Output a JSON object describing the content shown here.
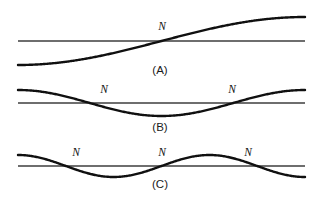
{
  "figure": {
    "width": 316,
    "height": 197,
    "background_color": "#ffffff",
    "curve_color": "#101010",
    "axis_color": "#6e6e6e",
    "label_color": "#111111",
    "node_symbol": "N"
  },
  "chart_data": {
    "type": "line",
    "xlabel": "",
    "ylabel": "",
    "grid": false,
    "legend_position": "none",
    "panels": [
      {
        "caption": "(A)",
        "harmonic": 1,
        "node_count": 1,
        "axis_y": 41,
        "x_start": 18,
        "x_end": 305,
        "amplitude": 24,
        "half_cycles": 1,
        "phase": "rising",
        "node_labels": [
          {
            "text": "N",
            "x": 162,
            "y": 30
          }
        ],
        "node_x_positions": [
          162
        ],
        "caption_position": {
          "x": 160,
          "y": 74
        }
      },
      {
        "caption": "(B)",
        "harmonic": 2,
        "node_count": 2,
        "axis_y": 103,
        "x_start": 18,
        "x_end": 305,
        "amplitude": 13,
        "half_cycles": 2,
        "phase": "crest-first",
        "node_labels": [
          {
            "text": "N",
            "x": 104,
            "y": 93
          },
          {
            "text": "N",
            "x": 232,
            "y": 93
          }
        ],
        "node_x_positions": [
          90,
          233
        ],
        "caption_position": {
          "x": 160,
          "y": 131
        }
      },
      {
        "caption": "(C)",
        "harmonic": 3,
        "node_count": 3,
        "axis_y": 166,
        "x_start": 18,
        "x_end": 305,
        "amplitude": 11,
        "half_cycles": 3,
        "phase": "crest-first",
        "node_labels": [
          {
            "text": "N",
            "x": 76,
            "y": 156
          },
          {
            "text": "N",
            "x": 162,
            "y": 156
          },
          {
            "text": "N",
            "x": 248,
            "y": 156
          }
        ],
        "node_x_positions": [
          66,
          162,
          257
        ],
        "caption_position": {
          "x": 160,
          "y": 188
        }
      }
    ]
  }
}
